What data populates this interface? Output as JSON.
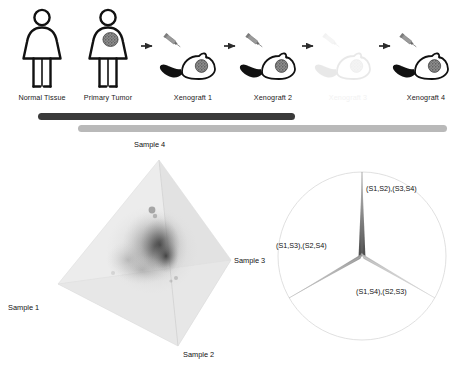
{
  "figure": {
    "width": 469,
    "height": 386,
    "background": "#ffffff"
  },
  "panel_flow": {
    "name": "xenograft-passage-flow",
    "stages": [
      {
        "id": "normal-tissue",
        "label": "Normal Tissue",
        "glyph": "human-female",
        "tumor": false,
        "faded": false,
        "x": 42,
        "y": 95
      },
      {
        "id": "primary-tumor",
        "label": "Primary Tumor",
        "glyph": "human-female",
        "tumor": true,
        "faded": false,
        "x": 108,
        "y": 95
      },
      {
        "id": "xenograft-1",
        "label": "Xenograft 1",
        "glyph": "mouse",
        "tumor": true,
        "faded": false,
        "x": 193,
        "y": 95
      },
      {
        "id": "xenograft-2",
        "label": "Xenograft 2",
        "glyph": "mouse",
        "tumor": true,
        "faded": false,
        "x": 273,
        "y": 95
      },
      {
        "id": "xenograft-3",
        "label": "Xenograft 3",
        "glyph": "mouse",
        "tumor": true,
        "faded": true,
        "x": 348,
        "y": 95
      },
      {
        "id": "xenograft-4",
        "label": "Xenograft 4",
        "glyph": "mouse",
        "tumor": true,
        "faded": false,
        "x": 426,
        "y": 95
      }
    ],
    "arrows": [
      {
        "id": "arrow-1",
        "x": 146
      },
      {
        "id": "arrow-2",
        "x": 230
      },
      {
        "id": "arrow-3",
        "x": 308
      },
      {
        "id": "arrow-4",
        "x": 385
      }
    ],
    "syringes": [
      {
        "id": "syringe-1",
        "x": 168
      },
      {
        "id": "syringe-2",
        "x": 250
      },
      {
        "id": "syringe-3",
        "x": 327
      },
      {
        "id": "syringe-4",
        "x": 404
      }
    ],
    "timeline_bars": [
      {
        "id": "bar-dark",
        "color": "#3a3a3a",
        "x": 38,
        "y": 113,
        "width": 257,
        "height": 7
      },
      {
        "id": "bar-light",
        "color": "#b9b9b9",
        "x": 78,
        "y": 125,
        "width": 369,
        "height": 7
      }
    ]
  },
  "panel_tetrahedron": {
    "name": "sample-tetrahedron-scatter",
    "vertex_labels": [
      {
        "id": "sample-4",
        "text": "Sample 4",
        "x": 155,
        "y": 142
      },
      {
        "id": "sample-3",
        "text": "Sample 3",
        "x": 228,
        "y": 256
      },
      {
        "id": "sample-1",
        "text": "Sample 1",
        "x": 30,
        "y": 304
      },
      {
        "id": "sample-2",
        "text": "Sample 2",
        "x": 190,
        "y": 350
      }
    ]
  },
  "panel_split_circle": {
    "name": "quartet-split-diagram",
    "center": {
      "x": 362,
      "y": 256
    },
    "radius": 84,
    "splits": [
      {
        "id": "split-s1s2-s3s4",
        "text": "(S1,S2),(S3,S4)",
        "label_x": 366,
        "label_y": 189,
        "weight": "high",
        "color": "#5a5a5a"
      },
      {
        "id": "split-s1s3-s2s4",
        "text": "(S1,S3),(S2,S4)",
        "label_x": 278,
        "label_y": 245,
        "weight": "medium",
        "color": "#9a9a9a"
      },
      {
        "id": "split-s1s4-s2s3",
        "text": "(S1,S4),(S2,S3)",
        "label_x": 356,
        "label_y": 291,
        "weight": "low",
        "color": "#c8c8c8"
      }
    ]
  }
}
